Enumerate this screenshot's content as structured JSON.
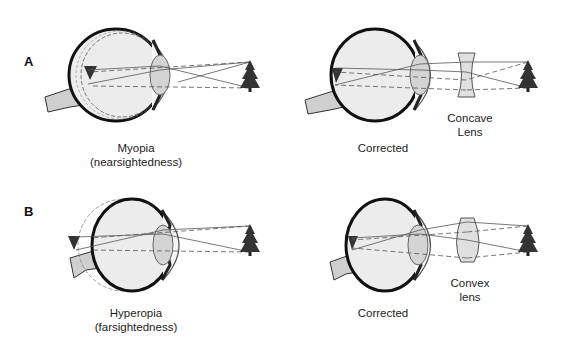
{
  "figure": {
    "panels": [
      {
        "letter": "A",
        "left": {
          "condition": "Myopia",
          "subtitle": "(nearsightedness)",
          "image_focus": "in front of retina"
        },
        "right": {
          "state": "Corrected",
          "lens_label_line1": "Concave",
          "lens_label_line2": "Lens",
          "lens_type": "concave"
        }
      },
      {
        "letter": "B",
        "left": {
          "condition": "Hyperopia",
          "subtitle": "(farsightedness)",
          "image_focus": "behind retina"
        },
        "right": {
          "state": "Corrected",
          "lens_label_line1": "Convex",
          "lens_label_line2": "lens",
          "lens_type": "convex"
        }
      }
    ],
    "colors": {
      "eye_fill": "#e6e6e6",
      "eye_outline": "#1a1a1a",
      "lens_fill": "#d4d4d4",
      "optic_nerve": "#cfcfcf",
      "tree": "#333333",
      "ray": "#555555",
      "text": "#222222"
    }
  }
}
